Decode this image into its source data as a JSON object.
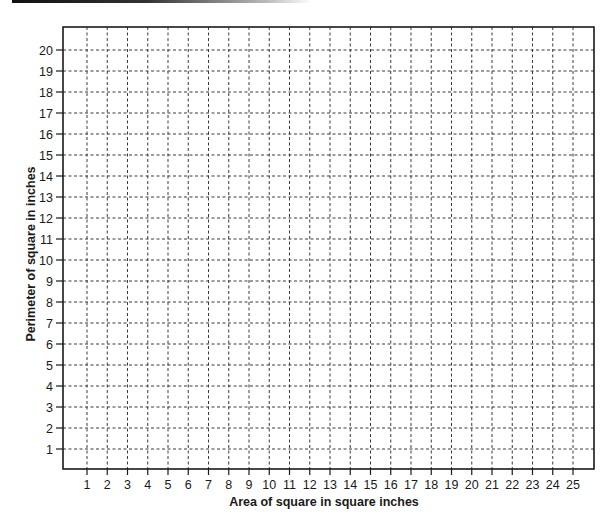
{
  "chart_data": {
    "type": "scatter",
    "title": "",
    "xlabel": "Area of square in square inches",
    "ylabel": "Perimeter of square in inches",
    "x_ticks": [
      1,
      2,
      3,
      4,
      5,
      6,
      7,
      8,
      9,
      10,
      11,
      12,
      13,
      14,
      15,
      16,
      17,
      18,
      19,
      20,
      21,
      22,
      23,
      24,
      25
    ],
    "y_ticks": [
      1,
      2,
      3,
      4,
      5,
      6,
      7,
      8,
      9,
      10,
      11,
      12,
      13,
      14,
      15,
      16,
      17,
      18,
      19,
      20
    ],
    "xlim": [
      0,
      25.5
    ],
    "ylim": [
      0,
      20.8
    ],
    "grid": true,
    "grid_style": "dashed",
    "series": [],
    "note": "Blank grid with no plotted data points"
  },
  "colors": {
    "axis": "#1a1a1a",
    "grid": "#3a3a3a",
    "background": "#ffffff"
  }
}
